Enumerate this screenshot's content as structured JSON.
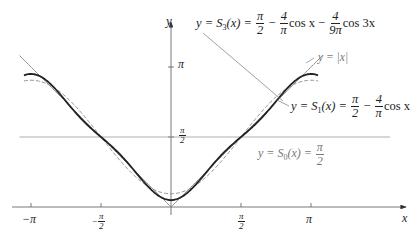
{
  "chart_data": {
    "type": "line",
    "title": "",
    "xlabel": "x",
    "ylabel": "y",
    "xlim": [
      -3.4,
      4.3
    ],
    "ylim": [
      0,
      4.0
    ],
    "grid": false,
    "x_ticks": [
      {
        "value": -3.14159,
        "label": "−π"
      },
      {
        "value": -1.5708,
        "label": "−π/2"
      },
      {
        "value": 1.5708,
        "label": "π/2"
      },
      {
        "value": 3.14159,
        "label": "π"
      }
    ],
    "y_ticks": [
      {
        "value": 1.5708,
        "label": "π/2"
      },
      {
        "value": 3.14159,
        "label": "π"
      }
    ],
    "series": [
      {
        "name": "y = |x|",
        "kind": "abs",
        "style": "thin-gray",
        "x_range": [
          -3.4,
          3.4
        ]
      },
      {
        "name": "y = S0(x) = π/2",
        "kind": "fourier",
        "a0": 1.5708,
        "terms": [],
        "style": "thin-gray-horizontal",
        "x_range": [
          -3.4,
          4.3
        ]
      },
      {
        "name": "y = S1(x) = π/2 − (4/π) cos x",
        "kind": "fourier",
        "a0": 1.5708,
        "terms": [
          {
            "k": 1,
            "coef": -1.27324
          }
        ],
        "style": "dashed-gray",
        "x_range": [
          -3.3,
          3.3
        ]
      },
      {
        "name": "y = S3(x) = π/2 − (4/π) cos x − (4/(9π)) cos 3x",
        "kind": "fourier",
        "a0": 1.5708,
        "terms": [
          {
            "k": 1,
            "coef": -1.27324
          },
          {
            "k": 3,
            "coef": -0.14147
          }
        ],
        "style": "thick-black",
        "x_range": [
          -3.3,
          3.3
        ]
      }
    ],
    "sampled_points": {
      "x": [
        -3.0,
        -2.0,
        -1.0,
        0.0,
        1.0,
        2.0,
        3.0
      ],
      "abs": [
        3.0,
        2.0,
        1.0,
        0.0,
        1.0,
        2.0,
        3.0
      ],
      "S1": [
        2.831,
        2.101,
        0.883,
        0.298,
        0.883,
        2.101,
        2.831
      ],
      "S3": [
        2.959,
        2.037,
        1.023,
        0.156,
        1.023,
        2.037,
        2.959
      ]
    }
  },
  "labels": {
    "y_axis": "y",
    "x_axis": "x",
    "tick_neg_pi": "−π",
    "tick_pi": "π",
    "tick_pi_num": "π",
    "tick_2": "2",
    "tick_neg": "−",
    "y_tick_pi": "π",
    "abs_label": "y = |x|",
    "s3": {
      "lhs": "y = S",
      "sub": "3",
      "arg": "(x) =",
      "f1n": "π",
      "f1d": "2",
      "minus1": "−",
      "f2n": "4",
      "f2d": "π",
      "cos1": "cos x",
      "minus2": "−",
      "f3n": "4",
      "f3d": "9π",
      "cos3": "cos 3x"
    },
    "s1": {
      "lhs": "y = S",
      "sub": "1",
      "arg": "(x) =",
      "f1n": "π",
      "f1d": "2",
      "minus1": "−",
      "f2n": "4",
      "f2d": "π",
      "cos1": "cos x"
    },
    "s0": {
      "lhs": "y = S",
      "sub": "0",
      "arg": "(x) =",
      "f1n": "π",
      "f1d": "2"
    }
  },
  "geometry": {
    "origin_x": 171,
    "origin_y": 207,
    "scale": 44.56
  }
}
